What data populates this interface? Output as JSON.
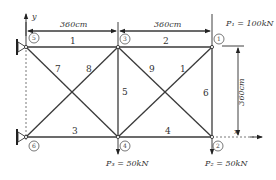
{
  "diagram": {
    "axes": {
      "x_label": "x",
      "y_label": "y"
    },
    "dimensions": {
      "top_left_span": "360cm",
      "top_right_span": "360cm",
      "height": "360cm"
    },
    "nodes": [
      {
        "id": "1",
        "label": "1",
        "position": "top-right"
      },
      {
        "id": "2",
        "label": "2",
        "position": "bottom-right"
      },
      {
        "id": "3",
        "label": "3",
        "position": "top-middle"
      },
      {
        "id": "4",
        "label": "4",
        "position": "bottom-middle"
      },
      {
        "id": "5",
        "label": "5",
        "position": "top-left",
        "support": "pin"
      },
      {
        "id": "6",
        "label": "6",
        "position": "bottom-left",
        "support": "pin"
      }
    ],
    "members": [
      {
        "id": "1",
        "label": "1",
        "from": "5",
        "to": "3"
      },
      {
        "id": "2",
        "label": "2",
        "from": "3",
        "to": "1"
      },
      {
        "id": "3",
        "label": "3",
        "from": "6",
        "to": "4"
      },
      {
        "id": "4",
        "label": "4",
        "from": "4",
        "to": "2"
      },
      {
        "id": "5",
        "label": "5",
        "from": "3",
        "to": "4"
      },
      {
        "id": "6",
        "label": "6",
        "from": "1",
        "to": "2"
      },
      {
        "id": "7",
        "label": "7",
        "from": "5",
        "to": "4"
      },
      {
        "id": "8",
        "label": "8",
        "from": "6",
        "to": "3"
      },
      {
        "id": "9",
        "label": "9",
        "from": "3",
        "to": "2"
      },
      {
        "id": "10",
        "label": "1",
        "from": "4",
        "to": "1"
      }
    ],
    "loads": [
      {
        "id": "P1",
        "label": "P₁ = 100kN",
        "node": "1",
        "direction": "down"
      },
      {
        "id": "P2",
        "label": "P₂ = 50kN",
        "node": "2",
        "direction": "down"
      },
      {
        "id": "P3",
        "label": "P₃ = 50kN",
        "node": "4",
        "direction": "down"
      }
    ]
  }
}
